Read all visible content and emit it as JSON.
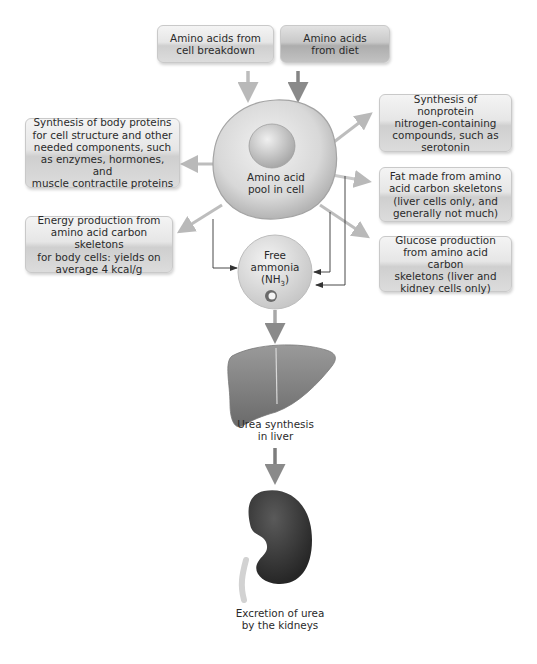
{
  "diagram": {
    "center": {
      "label_line1": "Amino acid",
      "label_line2": "pool in cell"
    },
    "inputs": [
      {
        "id": "cell-breakdown",
        "line1": "Amino acids from",
        "line2": "cell breakdown"
      },
      {
        "id": "diet",
        "line1": "Amino acids",
        "line2": "from diet"
      }
    ],
    "outputs_left": [
      {
        "id": "body-proteins",
        "lines": [
          "Synthesis of body proteins",
          "for cell structure and other",
          "needed components, such",
          "as enzymes, hormones, and",
          "muscle contractile proteins"
        ]
      },
      {
        "id": "energy",
        "lines": [
          "Energy production from",
          "amino acid carbon skeletons",
          "for body cells: yields on",
          "average 4 kcal/g"
        ]
      }
    ],
    "outputs_right": [
      {
        "id": "nonprotein-nitrogen",
        "lines": [
          "Synthesis of nonprotein",
          "nitrogen-containing",
          "compounds, such as",
          "serotonin"
        ]
      },
      {
        "id": "fat",
        "lines": [
          "Fat made from amino",
          "acid carbon skeletons",
          "(liver cells only, and",
          "generally not much)"
        ]
      },
      {
        "id": "glucose",
        "lines": [
          "Glucose production",
          "from amino acid carbon",
          "skeletons (liver and",
          "kidney cells only)"
        ]
      }
    ],
    "ammonia": {
      "line1": "Free",
      "line2": "ammonia",
      "line3_pre": "(NH",
      "line3_sub": "3",
      "line3_post": ")"
    },
    "liver": {
      "line1": "Urea synthesis",
      "line2": "in liver"
    },
    "kidney": {
      "line1": "Excretion of urea",
      "line2": "by the kidneys"
    }
  },
  "colors": {
    "arrow_light": "#b9b9b9",
    "arrow_dark": "#8a8a8a",
    "thin_line": "#444444",
    "liver": "#8c8c8c",
    "kidney": "#3c3c3c"
  }
}
